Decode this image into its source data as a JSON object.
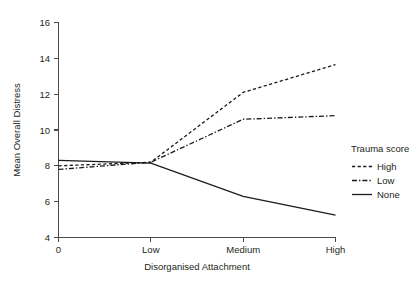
{
  "chart_data": {
    "type": "line",
    "title": "",
    "xlabel": "Disorganised Attachment",
    "ylabel": "Mean Overall Distress",
    "categories": [
      "0",
      "Low",
      "Medium",
      "High"
    ],
    "x_tick_labels": [
      "0",
      "Low",
      "Medium",
      "High"
    ],
    "y_tick_labels": [
      "4",
      "6",
      "8",
      "10",
      "12",
      "14",
      "16"
    ],
    "y_ticks": [
      4,
      6,
      8,
      10,
      12,
      14,
      16
    ],
    "ylim": [
      4,
      16
    ],
    "grid": false,
    "legend_position": "right",
    "legend_title": "Trauma score",
    "series": [
      {
        "name": "High",
        "style": "dashed",
        "color": "#1b1b1b",
        "values": [
          8.0,
          8.2,
          12.1,
          13.65
        ]
      },
      {
        "name": "Low",
        "style": "dash-dot",
        "color": "#1b1b1b",
        "values": [
          7.8,
          8.2,
          10.6,
          10.8
        ]
      },
      {
        "name": "None",
        "style": "solid",
        "color": "#1b1b1b",
        "values": [
          8.3,
          8.15,
          6.3,
          5.25
        ]
      }
    ]
  },
  "axes": {
    "x_title": "Disorganised Attachment",
    "y_title": "Mean Overall Distress"
  },
  "legend": {
    "title": "Trauma score",
    "entries": [
      {
        "label": "High",
        "style": "dashed"
      },
      {
        "label": "Low",
        "style": "dash-dot"
      },
      {
        "label": "None",
        "style": "solid"
      }
    ]
  },
  "caption": {
    "text": ""
  }
}
